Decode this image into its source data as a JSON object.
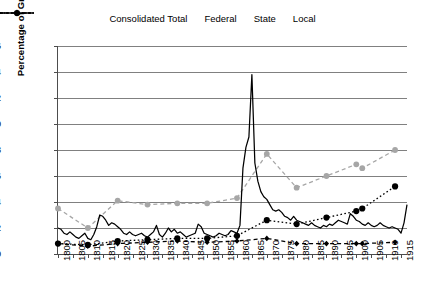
{
  "chart": {
    "type": "line",
    "title": "",
    "xlabel": "",
    "ylabel": "Percentage of Gross Domestic Product",
    "ylim": [
      0,
      16
    ],
    "ytick_step": 2,
    "xlim": [
      1800,
      1917
    ],
    "grid": "horizontal",
    "legend_position": "top-center"
  },
  "legend": {
    "items": [
      {
        "label": "Consolidated Total",
        "style": "dashed-marker",
        "color": "#a6a6a6",
        "marker": "circle"
      },
      {
        "label": "Federal",
        "style": "solid",
        "color": "#000000",
        "marker": "none"
      },
      {
        "label": "State",
        "style": "dashed-marker",
        "color": "#000000",
        "marker": "diamond"
      },
      {
        "label": "Local",
        "style": "dotted-marker",
        "color": "#000000",
        "marker": "circle"
      }
    ]
  },
  "axes": {
    "y_ticks": [
      "0",
      "2",
      "4",
      "6",
      "8",
      "10",
      "12",
      "14",
      "16"
    ],
    "x_ticks": [
      "1800",
      "1805",
      "1810",
      "1815",
      "1820",
      "1825",
      "1830",
      "1835",
      "1840",
      "1845",
      "1850",
      "1855",
      "1860",
      "1865",
      "1870",
      "1875",
      "1880",
      "1885",
      "1890",
      "1895",
      "1900",
      "1905",
      "1910",
      "1915"
    ]
  },
  "chart_data": {
    "type": "line",
    "title": "",
    "xlabel": "",
    "ylabel": "Percentage of Gross Domestic Product",
    "ylim": [
      0,
      16
    ],
    "xlim": [
      1800,
      1917
    ],
    "grid": true,
    "legend_position": "top-center",
    "series": [
      {
        "name": "Consolidated Total",
        "color": "#a6a6a6",
        "marker": "circle",
        "linestyle": "dashed",
        "x": [
          1800,
          1810,
          1820,
          1830,
          1840,
          1850,
          1860,
          1870,
          1880,
          1890,
          1900,
          1902,
          1913
        ],
        "values": [
          3.5,
          2.0,
          4.1,
          3.8,
          3.9,
          3.9,
          4.3,
          7.7,
          5.1,
          6.0,
          6.9,
          6.6,
          8.0
        ]
      },
      {
        "name": "Federal",
        "color": "#000000",
        "marker": "none",
        "linestyle": "solid",
        "x": [
          1800,
          1801,
          1802,
          1803,
          1804,
          1805,
          1806,
          1807,
          1808,
          1809,
          1810,
          1811,
          1812,
          1813,
          1814,
          1815,
          1816,
          1817,
          1818,
          1819,
          1820,
          1821,
          1822,
          1823,
          1824,
          1825,
          1826,
          1827,
          1828,
          1829,
          1830,
          1831,
          1832,
          1833,
          1834,
          1835,
          1836,
          1837,
          1838,
          1839,
          1840,
          1841,
          1842,
          1843,
          1844,
          1845,
          1846,
          1847,
          1848,
          1849,
          1850,
          1851,
          1852,
          1853,
          1854,
          1855,
          1856,
          1857,
          1858,
          1859,
          1860,
          1861,
          1862,
          1863,
          1864,
          1865,
          1866,
          1867,
          1868,
          1869,
          1870,
          1871,
          1872,
          1873,
          1874,
          1875,
          1876,
          1877,
          1878,
          1879,
          1880,
          1881,
          1882,
          1883,
          1884,
          1885,
          1886,
          1887,
          1888,
          1889,
          1890,
          1891,
          1892,
          1893,
          1894,
          1895,
          1896,
          1897,
          1898,
          1899,
          1900,
          1901,
          1902,
          1903,
          1904,
          1905,
          1906,
          1907,
          1908,
          1909,
          1910,
          1911,
          1912,
          1913,
          1914,
          1915,
          1916,
          1917
        ],
        "values": [
          2.0,
          1.9,
          1.6,
          1.5,
          1.7,
          1.5,
          1.3,
          1.2,
          1.4,
          1.6,
          1.2,
          1.1,
          1.5,
          2.1,
          3.0,
          2.9,
          2.6,
          2.2,
          2.4,
          2.3,
          2.1,
          1.9,
          1.6,
          1.5,
          1.7,
          1.5,
          1.4,
          1.5,
          1.6,
          1.4,
          1.3,
          1.5,
          1.7,
          2.2,
          1.5,
          1.3,
          1.6,
          2.0,
          1.7,
          1.9,
          1.6,
          1.7,
          1.5,
          1.3,
          1.4,
          1.5,
          1.6,
          2.3,
          2.1,
          1.6,
          1.5,
          1.4,
          1.3,
          1.4,
          1.6,
          1.5,
          1.4,
          1.5,
          1.8,
          1.7,
          1.6,
          2.2,
          6.6,
          8.2,
          9.0,
          13.8,
          7.0,
          5.6,
          4.8,
          4.4,
          4.2,
          3.8,
          3.4,
          3.3,
          3.4,
          3.2,
          2.9,
          2.8,
          2.6,
          2.9,
          2.6,
          2.5,
          2.4,
          2.3,
          2.2,
          2.4,
          2.2,
          2.1,
          2.0,
          2.2,
          2.1,
          2.3,
          2.2,
          2.4,
          2.6,
          2.5,
          2.4,
          2.3,
          3.1,
          2.9,
          2.6,
          2.5,
          2.3,
          2.2,
          2.4,
          2.2,
          2.1,
          2.2,
          2.4,
          2.2,
          2.1,
          2.0,
          2.1,
          2.0,
          1.9,
          1.6,
          2.4,
          3.8
        ]
      },
      {
        "name": "State",
        "color": "#000000",
        "marker": "diamond",
        "linestyle": "dashed",
        "x": [
          1800,
          1810,
          1820,
          1830,
          1840,
          1850,
          1860,
          1870,
          1880,
          1890,
          1900,
          1902,
          1913
        ],
        "values": [
          0.8,
          0.6,
          0.8,
          0.9,
          1.0,
          0.9,
          1.0,
          1.2,
          0.8,
          0.8,
          0.8,
          0.8,
          0.9
        ]
      },
      {
        "name": "Local",
        "color": "#000000",
        "marker": "circle",
        "linestyle": "dotted",
        "x": [
          1800,
          1810,
          1820,
          1830,
          1840,
          1850,
          1860,
          1870,
          1880,
          1890,
          1900,
          1902,
          1913
        ],
        "values": [
          0.8,
          0.7,
          1.0,
          1.1,
          1.2,
          1.2,
          1.4,
          2.6,
          2.3,
          2.8,
          3.3,
          3.5,
          5.2
        ]
      }
    ]
  }
}
